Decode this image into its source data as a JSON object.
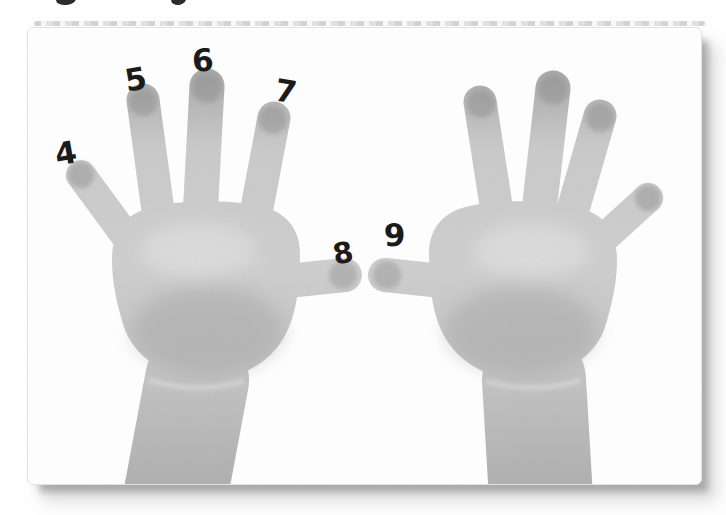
{
  "photo": {
    "subject": "black-and-white photograph of two child hands, palms facing forward, fingers spread, forearms running off the bottom edge",
    "finger_labels": [
      "4",
      "5",
      "6",
      "7",
      "8",
      "9"
    ]
  },
  "colors": {
    "page_background": "#fefefe",
    "card_background": "#ffffff",
    "card_border": "#e2e2e2",
    "drop_shadow": "#9d9d9d",
    "skin_light": "#d2d2d2",
    "skin_mid": "#c4c4c4",
    "skin_dark": "#a2a2a2",
    "label_color": "#1b1b1b"
  }
}
